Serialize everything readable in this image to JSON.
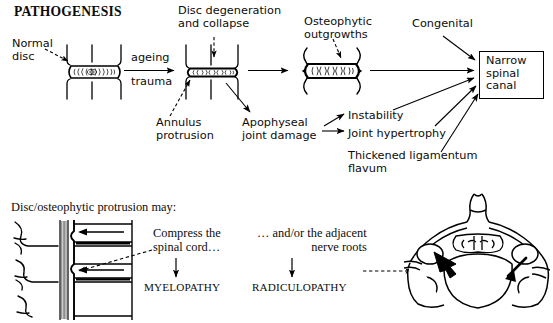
{
  "title": "PATHOGENESIS",
  "flow": {
    "normal_disc": "Normal\ndisc",
    "ageing": "ageing",
    "trauma": "trauma",
    "disc_degeneration": "Disc degeneration\nand collapse",
    "annulus_protrusion": "Annulus\nprotrusion",
    "apophyseal_joint_damage": "Apophyseal\njoint damage",
    "osteophytic_outgrowths": "Osteophytic\noutgrowths",
    "congenital": "Congenital",
    "instability": "Instability",
    "joint_hypertrophy": "Joint hypertrophy",
    "thickened_ligamentum_flavum": "Thickened ligamentum\nflavum",
    "narrow_spinal_canal": "Narrow\nspinal\ncanal"
  },
  "lower": {
    "heading": "Disc/osteophytic protrusion may:",
    "compress_cord": "Compress the\nspinal cord…",
    "myelopathy": "MYELOPATHY",
    "nerve_roots": "… and/or the adjacent\nnerve roots",
    "radiculopathy": "RADICULOPATHY"
  },
  "figures": {
    "disc_normal": "normal-disc-illustration",
    "disc_degenerate": "degenerate-disc-illustration",
    "disc_osteophytic": "osteophytic-disc-illustration",
    "spine_sagittal": "sagittal-spine-illustration",
    "vertebra_axial": "axial-cervical-vertebra-illustration"
  },
  "colors": {
    "ink": "#000000",
    "paper": "#ffffff"
  }
}
